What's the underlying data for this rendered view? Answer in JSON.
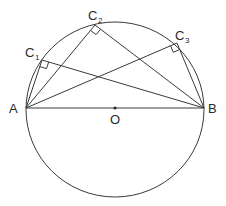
{
  "diagram": {
    "type": "geometry",
    "circle": {
      "cx": 115,
      "cy": 109.5,
      "rx": 89,
      "ry": 87.5
    },
    "points": {
      "A": {
        "x": 26,
        "y": 108,
        "label": "A"
      },
      "B": {
        "x": 204,
        "y": 108,
        "label": "B"
      },
      "O": {
        "x": 115,
        "y": 108,
        "label": "O"
      },
      "C1": {
        "x": 42,
        "y": 60,
        "label": "C",
        "sub": "1"
      },
      "C2": {
        "x": 95,
        "y": 25,
        "label": "C",
        "sub": "2"
      },
      "C3": {
        "x": 177,
        "y": 43,
        "label": "C",
        "sub": "3"
      }
    },
    "segments": [
      [
        "A",
        "B"
      ],
      [
        "A",
        "C1"
      ],
      [
        "C1",
        "B"
      ],
      [
        "A",
        "C2"
      ],
      [
        "C2",
        "B"
      ],
      [
        "A",
        "C3"
      ],
      [
        "C3",
        "B"
      ]
    ],
    "right_angle_markers": [
      "C1",
      "C2",
      "C3"
    ],
    "labels": {
      "A": "A",
      "B": "B",
      "O": "O",
      "C1_main": "C",
      "C1_sub": "1",
      "C2_main": "C",
      "C2_sub": "2",
      "C3_main": "C",
      "C3_sub": "3"
    },
    "colors": {
      "line": "#3a3a3a",
      "text": "#2a2a2a",
      "background": "#ffffff"
    }
  }
}
